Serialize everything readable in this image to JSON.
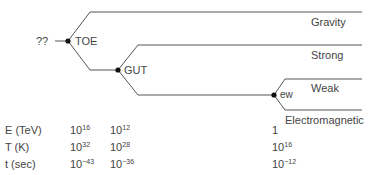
{
  "diagram": {
    "origin_label": "??",
    "nodes": {
      "toe": "TOE",
      "gut": "GUT",
      "ew": "ew"
    },
    "forces": {
      "gravity": "Gravity",
      "strong": "Strong",
      "weak": "Weak",
      "electromagnetic": "Electromagnetic"
    },
    "line_color": "#555555"
  },
  "table": {
    "rows": [
      {
        "label": "E (TeV)",
        "toe": {
          "base": "10",
          "exp": "16"
        },
        "gut": {
          "base": "10",
          "exp": "12"
        },
        "ew": {
          "base": "1",
          "exp": ""
        }
      },
      {
        "label": "T (K)",
        "toe": {
          "base": "10",
          "exp": "32"
        },
        "gut": {
          "base": "10",
          "exp": "28"
        },
        "ew": {
          "base": "10",
          "exp": "16"
        }
      },
      {
        "label": "t (sec)",
        "toe": {
          "base": "10",
          "exp": "−43"
        },
        "gut": {
          "base": "10",
          "exp": "−36"
        },
        "ew": {
          "base": "10",
          "exp": "−12"
        }
      }
    ]
  }
}
